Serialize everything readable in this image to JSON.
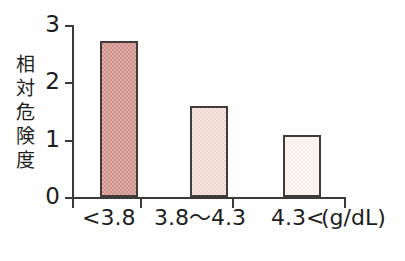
{
  "chart_data": {
    "type": "bar",
    "title": "",
    "subtitle": "",
    "xlabel": "",
    "ylabel": "相対危険度",
    "unit_label": "(g/dL)",
    "categories": [
      "<3.8",
      "3.8〜4.3",
      "4.3<"
    ],
    "values": [
      2.65,
      1.55,
      1.05
    ],
    "ylim": [
      0,
      3
    ],
    "ytick_labels": [
      "0",
      "1",
      "2",
      "3"
    ],
    "ytick_values": [
      0,
      1,
      2,
      3
    ],
    "grid": false,
    "legend": false,
    "bar_colors": [
      "#cf8e86",
      "#f0d8d1",
      "#f9efe9"
    ],
    "bar_outline_color": "#403c3a",
    "axis_color": "#3a3a3a",
    "background_color": "#fefefe"
  },
  "axis": {
    "y_title_chars": [
      "相",
      "対",
      "危",
      "険",
      "度"
    ]
  }
}
